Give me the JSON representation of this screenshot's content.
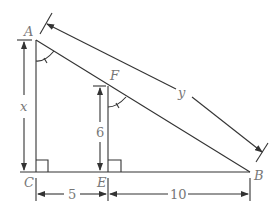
{
  "diagram": {
    "points": {
      "A": {
        "label": "A",
        "x": 36,
        "y": 40
      },
      "B": {
        "label": "B",
        "x": 250,
        "y": 172
      },
      "C": {
        "label": "C",
        "x": 36,
        "y": 172
      },
      "E": {
        "label": "E",
        "x": 108,
        "y": 172
      },
      "F": {
        "label": "F",
        "x": 108,
        "y": 86
      }
    },
    "dimensions": {
      "AC": "x",
      "FE": "6",
      "AB": "y",
      "CE": "5",
      "EB": "10"
    },
    "right_angles": [
      "C",
      "E"
    ],
    "equal_angles": [
      "CAB",
      "EFB"
    ],
    "colors": {
      "line": "#333333",
      "label": "#777777"
    }
  }
}
